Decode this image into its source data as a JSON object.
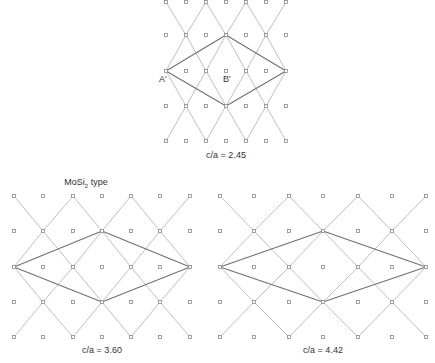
{
  "figures": [
    {
      "id": "top",
      "caption": "c/a = 2.45",
      "caption_pos": [
        226,
        150
      ],
      "title": null,
      "xs": [
        166,
        186,
        206,
        226,
        246,
        266,
        286
      ],
      "ys": [
        2,
        35,
        71,
        106,
        141
      ],
      "point_labels": [
        {
          "text": "A'",
          "x": 159,
          "y": 74
        },
        {
          "text": "B'",
          "x": 223,
          "y": 74
        }
      ]
    },
    {
      "id": "bottom-left",
      "caption": "c/a = 3.60",
      "caption_pos": [
        102,
        345
      ],
      "title": {
        "text": "MoSi",
        "sub": "2",
        "suffix": " type",
        "x": 86,
        "y": 177
      },
      "xs": [
        14,
        43,
        73,
        102,
        131,
        160,
        190
      ],
      "ys": [
        196,
        231,
        267,
        302,
        337
      ],
      "point_labels": []
    },
    {
      "id": "bottom-right",
      "caption": "c/a = 4.42",
      "caption_pos": [
        323,
        345
      ],
      "title": null,
      "xs": [
        220,
        254,
        289,
        323,
        358,
        392,
        426
      ],
      "ys": [
        196,
        231,
        267,
        302,
        337
      ],
      "point_labels": []
    }
  ],
  "colors": {
    "background": "#ffffff",
    "lattice_line": "#b8b8b8",
    "cell_outline": "#707070",
    "point": "#8a8a8a",
    "text": "#333333"
  }
}
